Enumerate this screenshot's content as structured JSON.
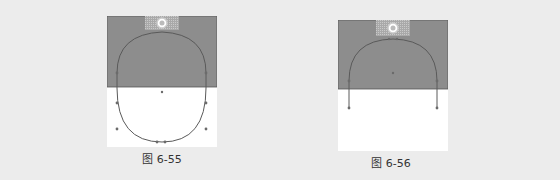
{
  "figures": [
    {
      "id": "fig-6-55",
      "caption": "图 6-55",
      "description": "Gray rectangle with spotlight circle; closed U-shaped path extends from gray area into white area below"
    },
    {
      "id": "fig-6-56",
      "caption": "图 6-56",
      "description": "Gray rectangle with spotlight circle; arch path with open ends extending slightly below gray area"
    }
  ],
  "colors": {
    "page_bg": "#ececec",
    "panel_gray": "#8d8d8d",
    "panel_white": "#ffffff",
    "path_stroke": "#5a5a5a",
    "anchor_point": "#6b6b6b"
  }
}
